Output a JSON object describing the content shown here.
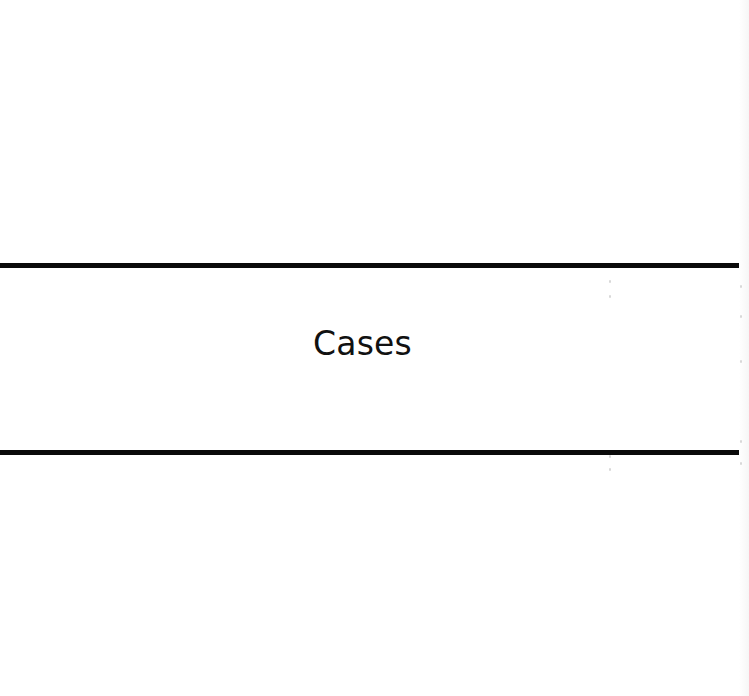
{
  "page": {
    "section_title": "Cases"
  },
  "colors": {
    "background": "#ffffff",
    "rule": "#0a0a0a",
    "text": "#111111"
  }
}
